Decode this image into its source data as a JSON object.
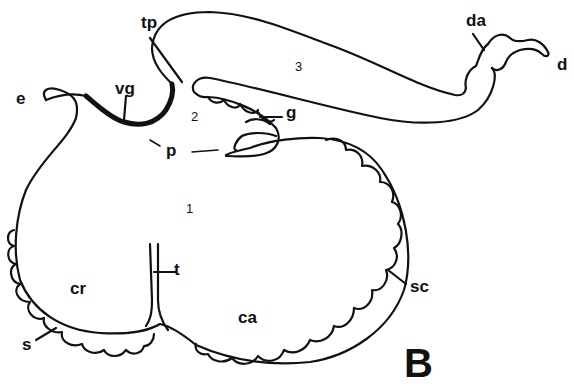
{
  "figure": {
    "panel_letter": "B",
    "region_numbers": [
      "1",
      "2",
      "3"
    ],
    "labels": {
      "tp": "tp",
      "vg": "vg",
      "e": "e",
      "p": "p",
      "g": "g",
      "da": "da",
      "d": "d",
      "t": "t",
      "cr": "cr",
      "ca": "ca",
      "s": "s",
      "sc": "sc"
    }
  }
}
